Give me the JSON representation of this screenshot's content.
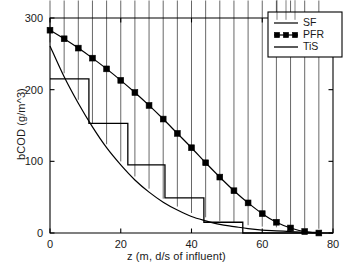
{
  "chart_data": {
    "type": "line",
    "title": "",
    "xlabel": "z (m, d/s of influent)",
    "ylabel": "bCOD (g/m^3)",
    "xlim": [
      0,
      80
    ],
    "ylim": [
      0,
      300
    ],
    "xticks": [
      0,
      20,
      40,
      60,
      80
    ],
    "yticks": [
      0,
      100,
      200,
      300
    ],
    "xtick_labels": [
      "0",
      "20",
      "40",
      "60",
      "80"
    ],
    "ytick_labels": [
      "0",
      "100",
      "200",
      "300"
    ],
    "grid": false,
    "legend_position": "top-right",
    "line_color": "#000000",
    "background_color": "#ffffff",
    "series": [
      {
        "name": "SF",
        "marker": "diamond",
        "x": [
          0,
          4,
          8,
          12,
          16,
          20,
          24,
          28,
          32,
          36,
          40,
          44,
          48,
          52,
          56,
          60,
          64,
          68,
          72,
          76
        ],
        "y": [
          261,
          218,
          181,
          148,
          119,
          95,
          74,
          57,
          43,
          32,
          23,
          17,
          12,
          9,
          6,
          4,
          3,
          2,
          1,
          1
        ]
      },
      {
        "name": "PFR",
        "marker": "square",
        "x": [
          0,
          4,
          8,
          12,
          16,
          20,
          24,
          28,
          32,
          36,
          40,
          44,
          48,
          52,
          56,
          60,
          64,
          68,
          72,
          76
        ],
        "y": [
          283,
          271,
          258,
          244,
          229,
          213,
          196,
          178,
          159,
          139,
          119,
          98,
          78,
          59,
          42,
          27,
          15,
          7,
          2,
          0
        ]
      },
      {
        "name": "TiS",
        "marker": "none",
        "step_edges": [
          0,
          11,
          22,
          32.5,
          43.5,
          54.5
        ],
        "step_levels": [
          215,
          153,
          95,
          49,
          15
        ],
        "y_after_last_edge": 0
      }
    ],
    "legend": [
      {
        "label": "SF",
        "marker": "diamond"
      },
      {
        "label": "PFR",
        "marker": "square"
      },
      {
        "label": "TiS",
        "marker": "line"
      }
    ]
  }
}
